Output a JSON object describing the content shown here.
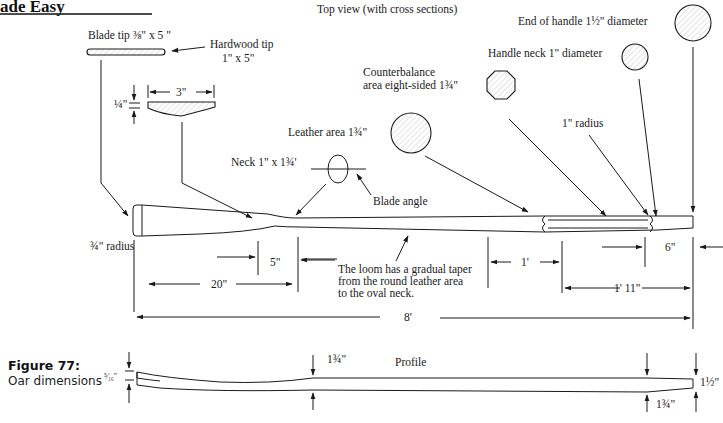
{
  "header": {
    "title": "ade Easy"
  },
  "figure": {
    "number": "Figure 77:",
    "caption": "Oar dimensions"
  },
  "top_view": {
    "title": "Top view (with cross sections)",
    "labels": {
      "blade_tip": "Blade tip ⅜\" x 5 \"",
      "hardwood_tip_line1": "Hardwood tip",
      "hardwood_tip_line2": "1\" x 5\"",
      "quarter_inch": "¼\"",
      "three_inch": "3\"",
      "neck": "Neck 1\" x 1¾'",
      "leather_area": "Leather area 1¾\"",
      "blade_angle": "Blade angle",
      "counterbalance_line1": "Counterbalance",
      "counterbalance_line2": "area eight-sided 1¾\"",
      "handle_neck": "Handle neck 1\" diameter",
      "end_of_handle": "End of handle 1½\" diameter",
      "one_inch_radius": "1\" radius",
      "three_quarter_radius": "¾\" radius",
      "loom_note_line1": "The loom has a gradual taper",
      "loom_note_line2": "from the round leather area",
      "loom_note_line3": "to the oval neck."
    },
    "dimensions": {
      "d5": "5\"",
      "d20": "20\"",
      "d1ft": "1'",
      "d1ft11": "1' 11\"",
      "d6": "6\"",
      "d8ft": "8'"
    }
  },
  "profile": {
    "title": "Profile",
    "labels": {
      "five_sixteenths": "⁵⁄₁₆\"",
      "loom_thickness": "1¾\"",
      "handle_end": "1½\"",
      "handle_start": "1¾\""
    }
  }
}
